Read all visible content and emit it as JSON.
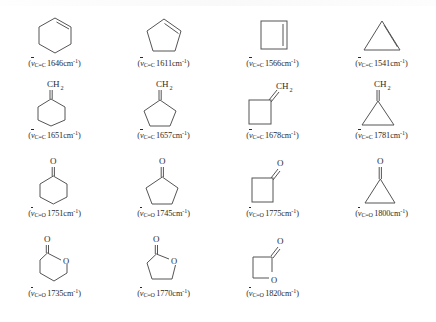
{
  "figure": {
    "type": "chemistry-structure-chart",
    "unit": "cm-1",
    "paren_open": "(",
    "paren_close": ")",
    "nu_symbol": "v",
    "unit_text": "cm",
    "unit_exp": "-1",
    "methylene_label": "CH",
    "methylene_sub": "2",
    "oxygen_label": "O"
  },
  "rows": [
    {
      "name": "cycloalkenes",
      "bond": "C=C",
      "bond_left": "C",
      "bond_right": "C",
      "items": [
        {
          "name": "cyclohexene",
          "shape": "hexene",
          "value": "1646",
          "label": "(v_C=C 1646cm-1)"
        },
        {
          "name": "cyclopentene",
          "shape": "pentene",
          "value": "1611",
          "label": "(v_C=C 1611cm-1)"
        },
        {
          "name": "cyclobutene",
          "shape": "butene",
          "value": "1566",
          "label": "(v_C=C 1566cm-1)"
        },
        {
          "name": "cyclopropene",
          "shape": "propene",
          "value": "1541",
          "label": "(v_C=C 1541cm-1)"
        }
      ]
    },
    {
      "name": "exocyclic-methylenes",
      "bond": "C=C",
      "bond_left": "C",
      "bond_right": "C",
      "items": [
        {
          "name": "methylenecyclohexane",
          "shape": "hexane-ch2",
          "value": "1651",
          "label": "(v_C=C 1651cm-1)"
        },
        {
          "name": "methylenecyclopentane",
          "shape": "pentane-ch2",
          "value": "1657",
          "label": "(v_C=C 1657cm-1)"
        },
        {
          "name": "methylenecyclobutane",
          "shape": "butane-ch2",
          "value": "1678",
          "label": "(v_C=C 1678cm-1)"
        },
        {
          "name": "methylenecyclopropane",
          "shape": "propane-ch2",
          "value": "1781",
          "label": "(v_C=C 1781cm-1)"
        }
      ]
    },
    {
      "name": "cyclic-ketones",
      "bond": "C=O",
      "bond_left": "C",
      "bond_right": "O",
      "items": [
        {
          "name": "cyclohexanone",
          "shape": "hexanone",
          "value": "1751",
          "label": "(v_C=O 1751cm-1)"
        },
        {
          "name": "cyclopentanone",
          "shape": "pentanone",
          "value": "1745",
          "label": "(v_C=O 1745cm-1)"
        },
        {
          "name": "cyclobutanone",
          "shape": "butanone",
          "value": "1775",
          "label": "(v_C=O 1775cm-1)"
        },
        {
          "name": "cyclopropanone",
          "shape": "propanone",
          "value": "1800",
          "label": "(v_C=O 1800cm-1)"
        }
      ]
    },
    {
      "name": "lactones",
      "bond": "C=O",
      "bond_left": "C",
      "bond_right": "O",
      "items": [
        {
          "name": "delta-valerolactone",
          "shape": "lactone6",
          "value": "1735",
          "label": "(v_C=O 1735cm-1)"
        },
        {
          "name": "gamma-butyrolactone",
          "shape": "lactone5",
          "value": "1770",
          "label": "(v_C=O 1770cm-1)"
        },
        {
          "name": "beta-propiolactone",
          "shape": "lactone4",
          "value": "1820",
          "label": "(v_C=O 1820cm-1)"
        }
      ]
    }
  ],
  "colors": {
    "ink": "#2b2b2b",
    "line": "#555555",
    "background": "#ffffff"
  }
}
